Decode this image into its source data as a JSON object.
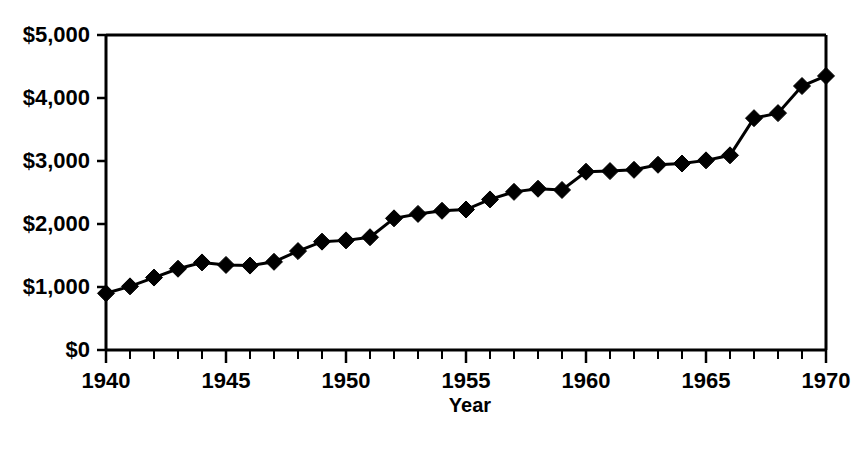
{
  "chart_data": {
    "type": "line",
    "title": "",
    "subtitle": "",
    "xlabel": "Year",
    "ylabel": "",
    "xlim": [
      1940,
      1970
    ],
    "ylim": [
      0,
      5000
    ],
    "grid": false,
    "legend": null,
    "marker": "diamond",
    "line_color": "#000000",
    "marker_color": "#000000",
    "background_color": "#ffffff",
    "x": [
      1940,
      1941,
      1942,
      1943,
      1944,
      1945,
      1946,
      1947,
      1948,
      1949,
      1950,
      1951,
      1952,
      1953,
      1954,
      1955,
      1956,
      1957,
      1958,
      1959,
      1960,
      1961,
      1962,
      1963,
      1964,
      1965,
      1966,
      1967,
      1968,
      1969,
      1970
    ],
    "values": [
      900,
      1010,
      1150,
      1290,
      1390,
      1350,
      1340,
      1400,
      1570,
      1720,
      1740,
      1790,
      2090,
      2160,
      2210,
      2230,
      2390,
      2510,
      2560,
      2540,
      2830,
      2840,
      2860,
      2940,
      2960,
      3010,
      3090,
      3680,
      3760,
      4190,
      4350
    ],
    "y_ticks": [
      0,
      1000,
      2000,
      3000,
      4000,
      5000
    ],
    "y_tick_labels": [
      "$0",
      "$1,000",
      "$2,000",
      "$3,000",
      "$4,000",
      "$5,000"
    ],
    "x_ticks_major": [
      1940,
      1945,
      1950,
      1955,
      1960,
      1965,
      1970
    ],
    "x_tick_labels": [
      "1940",
      "1945",
      "1950",
      "1955",
      "1960",
      "1965",
      "1970"
    ],
    "x_ticks_minor_step": 1
  }
}
